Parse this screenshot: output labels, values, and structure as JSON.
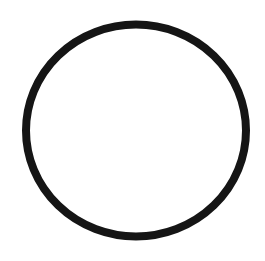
{
  "canvas": {
    "width": 265,
    "height": 261,
    "background": "#ffffff"
  },
  "shape": {
    "type": "circle-outline",
    "cx": 136,
    "cy": 130.5,
    "rx": 110,
    "ry": 106,
    "stroke": "#151515",
    "stroke_width": 8,
    "fill": "none"
  }
}
